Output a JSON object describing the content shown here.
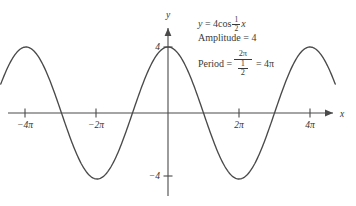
{
  "chart_data": {
    "type": "line",
    "title": "",
    "function": "y = 4cos(1/2 x)",
    "amplitude": 4,
    "period_value": "4π",
    "xlabel": "x",
    "ylabel": "y",
    "xlim": [
      -14.8,
      14.8
    ],
    "ylim": [
      -5.6,
      5.6
    ],
    "grid": false,
    "legend": "none",
    "x_tick_labels": [
      "−4π",
      "−2π",
      "2π",
      "4π"
    ],
    "x_tick_values": [
      -12.566,
      -6.283,
      6.283,
      12.566
    ],
    "y_tick_labels": [
      "4",
      "−4"
    ],
    "y_tick_values": [
      4,
      -4
    ],
    "series": [
      {
        "name": "y = 4cos(1/2 x)",
        "color": "#4a4a4a",
        "x": [
          -14.8,
          -13.8,
          -12.8,
          -11.8,
          -10.8,
          -9.8,
          -8.8,
          -7.8,
          -6.8,
          -5.8,
          -4.8,
          -3.8,
          -2.8,
          -1.8,
          -0.8,
          0.2,
          1.2,
          2.2,
          3.2,
          4.2,
          5.2,
          6.2,
          7.2,
          8.2,
          9.2,
          10.2,
          11.2,
          12.2,
          13.2,
          14.2,
          14.8
        ],
        "y": [
          2.67,
          3.32,
          3.79,
          4.0,
          3.93,
          3.61,
          3.06,
          2.33,
          1.47,
          0.55,
          -0.38,
          -1.28,
          -2.1,
          -2.82,
          -3.39,
          -3.8,
          -4.0,
          -3.98,
          -3.74,
          -3.3,
          -2.67,
          -1.91,
          -1.05,
          -0.15,
          0.76,
          1.65,
          2.46,
          3.15,
          3.67,
          3.95,
          4.0
        ]
      }
    ],
    "annotations": {
      "equation": "y = 4cos ½x",
      "amplitude_line": "Amplitude = 4",
      "period_line": "Period = 2π/½ = 4π"
    }
  },
  "annotations": {
    "eq_lhs": "y",
    "eq_eq": "=",
    "eq_coef": "4cos",
    "eq_frac_num": "1",
    "eq_frac_den": "2",
    "eq_var": "x",
    "amp_label": "Amplitude",
    "amp_eq": "=",
    "amp_value": "4",
    "period_label": "Period",
    "period_eq": "=",
    "period_num": "2π",
    "period_den_num": "1",
    "period_den_den": "2",
    "period_eq2": "=",
    "period_value": "4π"
  },
  "axes": {
    "x_name": "x",
    "y_name": "y",
    "x_ticks": [
      {
        "label": "−4π",
        "px": 25
      },
      {
        "label": "−2π",
        "px": 96
      },
      {
        "label": "2π",
        "px": 239
      },
      {
        "label": "4π",
        "px": 310
      }
    ],
    "y_ticks": [
      {
        "label": "4",
        "px": 47
      },
      {
        "label": "−4",
        "px": 176
      }
    ]
  }
}
